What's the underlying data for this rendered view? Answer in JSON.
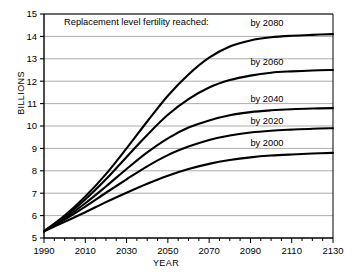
{
  "chart_data": {
    "type": "line",
    "title": "Replacement level fertility reached:",
    "xlabel": "YEAR",
    "ylabel": "BILLIONS",
    "xlim": [
      1990,
      2130
    ],
    "ylim": [
      5,
      15
    ],
    "grid": true,
    "legend_position": "inline-right-of-curves",
    "x_major_ticks": [
      1990,
      2010,
      2030,
      2050,
      2070,
      2090,
      2110,
      2130
    ],
    "x_minor_tick_step": 5,
    "y_ticks": [
      5,
      6,
      7,
      8,
      9,
      10,
      11,
      12,
      13,
      14,
      15
    ],
    "x_tick_labels": [
      "1990",
      "2010",
      "2030",
      "2050",
      "2070",
      "2090",
      "2110",
      "2130"
    ],
    "y_tick_labels": [
      "5",
      "6",
      "7",
      "8",
      "9",
      "10",
      "11",
      "12",
      "13",
      "14",
      "15"
    ],
    "line_color": "#000000",
    "grid_color": "#8a8a8a",
    "axis_color": "#000000",
    "x": [
      1990,
      2000,
      2010,
      2020,
      2030,
      2040,
      2050,
      2060,
      2070,
      2080,
      2090,
      2100,
      2110,
      2120,
      2130
    ],
    "series": [
      {
        "name": "by 2000",
        "label": "by 2000",
        "label_year": 2098,
        "label_value": 9.25,
        "plateau": 8.8,
        "values": [
          5.3,
          5.72,
          6.15,
          6.6,
          7.02,
          7.42,
          7.78,
          8.08,
          8.31,
          8.48,
          8.6,
          8.68,
          8.73,
          8.77,
          8.8
        ]
      },
      {
        "name": "by 2020",
        "label": "by 2020",
        "label_year": 2098,
        "label_value": 10.25,
        "plateau": 9.9,
        "values": [
          5.3,
          5.82,
          6.4,
          7.02,
          7.62,
          8.2,
          8.7,
          9.08,
          9.38,
          9.58,
          9.71,
          9.79,
          9.84,
          9.88,
          9.9
        ]
      },
      {
        "name": "by 2040",
        "label": "by 2040",
        "label_year": 2098,
        "label_value": 11.2,
        "plateau": 10.8,
        "values": [
          5.3,
          5.88,
          6.55,
          7.3,
          8.08,
          8.82,
          9.45,
          9.93,
          10.25,
          10.48,
          10.62,
          10.7,
          10.75,
          10.78,
          10.8
        ]
      },
      {
        "name": "by 2060",
        "label": "by 2060",
        "label_year": 2098,
        "label_value": 12.85,
        "plateau": 12.5,
        "values": [
          5.3,
          5.95,
          6.72,
          7.62,
          8.62,
          9.6,
          10.5,
          11.2,
          11.72,
          12.05,
          12.25,
          12.38,
          12.44,
          12.48,
          12.5
        ]
      },
      {
        "name": "by 2080",
        "label": "by 2080",
        "label_year": 2098,
        "label_value": 14.6,
        "plateau": 14.1,
        "values": [
          5.3,
          6.0,
          6.85,
          7.85,
          9.0,
          10.2,
          11.35,
          12.3,
          13.05,
          13.55,
          13.82,
          13.96,
          14.03,
          14.07,
          14.1
        ]
      }
    ]
  }
}
